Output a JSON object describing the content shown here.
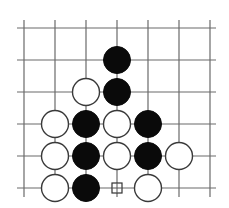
{
  "diagram": {
    "type": "go-board-fragment",
    "grid": {
      "columns": 7,
      "rows": 6,
      "x": [
        24,
        55,
        86,
        117,
        148,
        179,
        210
      ],
      "y": [
        28,
        60,
        92,
        124,
        156,
        188
      ],
      "line_extent": {
        "left": 17,
        "right": 216,
        "top": 20,
        "bottom": 197
      },
      "line_color": "#6a6a6a"
    },
    "stone_radius": 13.5,
    "colors": {
      "black": "#0a0a0a",
      "white": "#ffffff",
      "outline": "#3a3a3a"
    },
    "stones": [
      {
        "color": "black",
        "col": 3,
        "row": 1
      },
      {
        "color": "white",
        "col": 2,
        "row": 2
      },
      {
        "color": "black",
        "col": 3,
        "row": 2
      },
      {
        "color": "white",
        "col": 1,
        "row": 3
      },
      {
        "color": "black",
        "col": 2,
        "row": 3
      },
      {
        "color": "white",
        "col": 3,
        "row": 3
      },
      {
        "color": "black",
        "col": 4,
        "row": 3
      },
      {
        "color": "white",
        "col": 1,
        "row": 4
      },
      {
        "color": "black",
        "col": 2,
        "row": 4
      },
      {
        "color": "white",
        "col": 3,
        "row": 4
      },
      {
        "color": "black",
        "col": 4,
        "row": 4
      },
      {
        "color": "white",
        "col": 5,
        "row": 4
      },
      {
        "color": "white",
        "col": 1,
        "row": 5
      },
      {
        "color": "black",
        "col": 2,
        "row": 5
      },
      {
        "color": "white",
        "col": 4,
        "row": 5
      }
    ],
    "markers": [
      {
        "shape": "square",
        "col": 3,
        "row": 5,
        "size": 10
      }
    ]
  }
}
